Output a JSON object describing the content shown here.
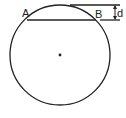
{
  "diagram": {
    "labels": {
      "point_a": "A",
      "point_b": "B",
      "distance": "d"
    },
    "colors": {
      "stroke": "#222222",
      "background": "#ffffff"
    }
  }
}
